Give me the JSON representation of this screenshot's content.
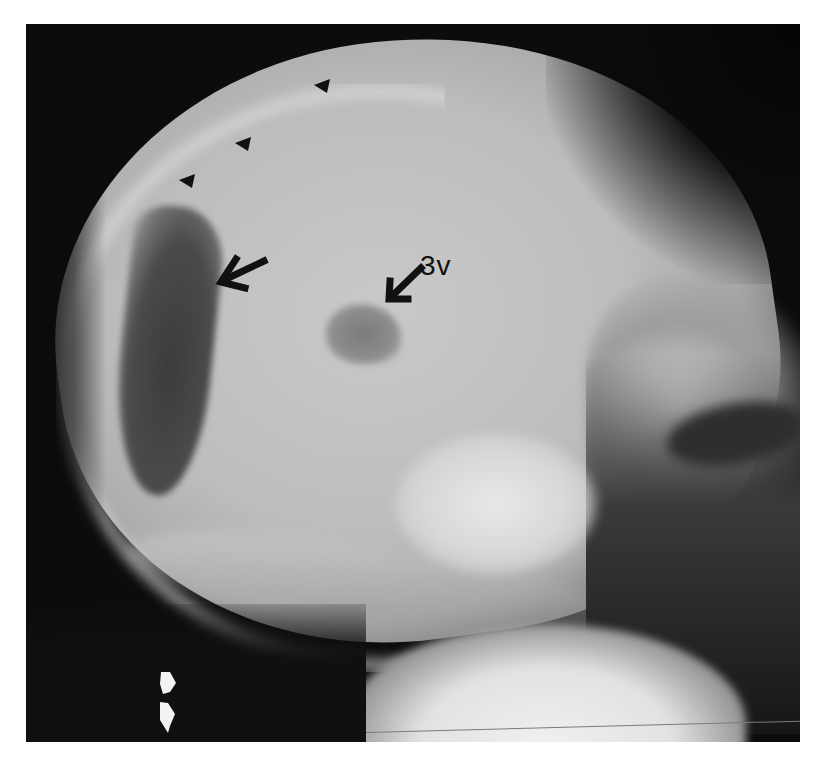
{
  "image": {
    "type": "lateral skull radiograph",
    "background": "#ffffff",
    "frame": {
      "left": 26,
      "top": 24,
      "width": 774,
      "height": 718
    }
  },
  "annotations": {
    "label_3v": "3v",
    "black_arrows": [
      {
        "name": "ventricle-arrow",
        "tip": [
          220,
          284
        ],
        "direction": "pointing-left-down"
      },
      {
        "name": "third-ventricle-arrow",
        "tip": [
          388,
          300
        ],
        "direction": "pointing-down-left"
      }
    ],
    "arrowheads": [
      {
        "name": "arrowhead-1",
        "position": [
          322,
          86
        ]
      },
      {
        "name": "arrowhead-2",
        "position": [
          243,
          143
        ]
      },
      {
        "name": "arrowhead-3",
        "position": [
          187,
          180
        ]
      }
    ],
    "white_arrows": [
      {
        "name": "white-arrow-upper",
        "position": [
          165,
          684
        ]
      },
      {
        "name": "white-arrow-lower",
        "position": [
          165,
          716
        ]
      }
    ],
    "colors": {
      "annotation_black": "#111111",
      "annotation_white": "#f2f2f2"
    }
  }
}
